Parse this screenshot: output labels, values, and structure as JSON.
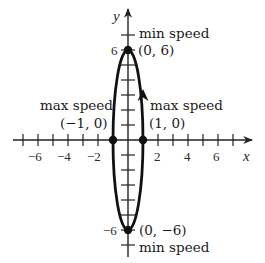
{
  "diagram": {
    "type": "ellipse-parametric-plot",
    "colors": {
      "curve": "#111111",
      "axis": "#222222",
      "text": "#1a1a1a",
      "background": "#ffffff"
    },
    "axes": {
      "x_label": "x",
      "y_label": "y",
      "x_ticks": [
        -7,
        -6,
        -5,
        -4,
        -3,
        -2,
        -1,
        1,
        2,
        3,
        4,
        5,
        6,
        7
      ],
      "y_ticks": [
        -7,
        -6,
        -5,
        -4,
        -3,
        -2,
        -1,
        1,
        2,
        3,
        4,
        5,
        6,
        7
      ],
      "x_tick_labels": [
        "-6",
        "-4",
        "-2",
        "2",
        "4",
        "6"
      ],
      "x_tick_label_display": [
        "−6",
        "−4",
        "−2",
        "2",
        "4",
        "6"
      ],
      "y_tick_labels_display": [
        "6",
        "−6"
      ]
    },
    "curve": {
      "shape": "ellipse",
      "a": 1,
      "b": 6,
      "direction": "counterclockwise"
    },
    "points": [
      {
        "coords": "(0, 6)",
        "annotation": "min speed"
      },
      {
        "coords": "(0, −6)",
        "annotation": "min speed"
      },
      {
        "coords": "(−1, 0)",
        "annotation": "max speed"
      },
      {
        "coords": "(1, 0)",
        "annotation": "max speed"
      }
    ]
  }
}
